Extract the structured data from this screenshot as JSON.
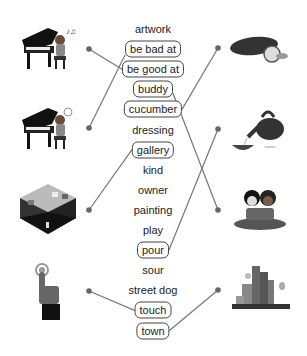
{
  "words": [
    {
      "text": "artwork",
      "boxed": false
    },
    {
      "text": "be bad at",
      "boxed": true
    },
    {
      "text": "be good at",
      "boxed": true
    },
    {
      "text": "buddy",
      "boxed": true
    },
    {
      "text": "cucumber",
      "boxed": true
    },
    {
      "text": "dressing",
      "boxed": false
    },
    {
      "text": "gallery",
      "boxed": true
    },
    {
      "text": "kind",
      "boxed": false
    },
    {
      "text": "owner",
      "boxed": false
    },
    {
      "text": "painting",
      "boxed": false
    },
    {
      "text": "play",
      "boxed": false
    },
    {
      "text": "pour",
      "boxed": true
    },
    {
      "text": "sour",
      "boxed": false
    },
    {
      "text": "street dog",
      "boxed": false
    },
    {
      "text": "touch",
      "boxed": true
    },
    {
      "text": "town",
      "boxed": true
    }
  ],
  "left_pictures": [
    {
      "icon": "piano-player-good-icon",
      "matched_word": "be good at"
    },
    {
      "icon": "piano-player-bad-icon",
      "matched_word": "be bad at"
    },
    {
      "icon": "art-gallery-icon",
      "matched_word": "gallery"
    },
    {
      "icon": "finger-touch-icon",
      "matched_word": "touch"
    }
  ],
  "right_pictures": [
    {
      "icon": "cucumber-icon",
      "matched_word": "cucumber"
    },
    {
      "icon": "teapot-pouring-icon",
      "matched_word": "pour"
    },
    {
      "icon": "buddies-icon",
      "matched_word": "buddy"
    },
    {
      "icon": "town-icon",
      "matched_word": "town"
    }
  ],
  "colors": {
    "line": "#777777",
    "dot": "#666666",
    "text": "#222222",
    "box_border": "#444444"
  }
}
